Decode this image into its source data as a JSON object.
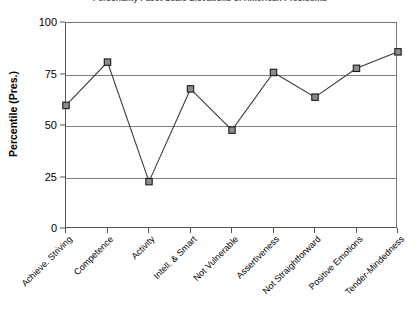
{
  "chart_data": {
    "type": "line",
    "title": "Personality Facet Scale Elevations of American Presidents",
    "xlabel": "",
    "ylabel": "Percentile (Pres.)",
    "ylim": [
      0,
      100
    ],
    "yticks": [
      0,
      25,
      50,
      75,
      100
    ],
    "grid": true,
    "legend": "none",
    "marker": "square",
    "marker_fill_color": "#8c8c8c",
    "marker_edge_color": "#1a1a1a",
    "line_color": "#3a3a3a",
    "categories": [
      "Achieve. Striving",
      "Competence",
      "Activity",
      "Intell. & Smart",
      "Not Vulnerable",
      "Assertiveness",
      "Not Straightforward",
      "Positive Emotions",
      "Tender-Mindedness"
    ],
    "values": [
      60,
      81,
      23,
      68,
      48,
      76,
      64,
      78,
      86
    ]
  }
}
